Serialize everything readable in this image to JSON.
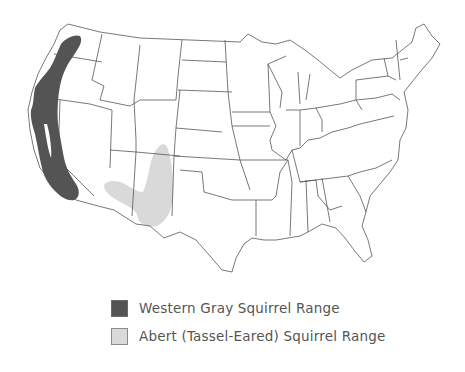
{
  "map": {
    "region": "Contiguous United States",
    "state_outline_color": "#555555",
    "land_fill": "#ffffff"
  },
  "legend": {
    "items": [
      {
        "label": "Western Gray Squirrel Range",
        "color": "#545454"
      },
      {
        "label": "Abert (Tassel-Eared) Squirrel Range",
        "color": "#d9d9d9"
      }
    ]
  }
}
